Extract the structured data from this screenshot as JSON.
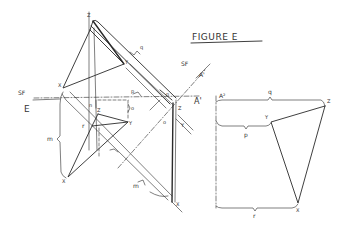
{
  "figure": {
    "title": "FIGURE E",
    "left_view": {
      "fold_line_label": "SF",
      "view_label": "E",
      "points_upper": {
        "z": "Z",
        "x": "X",
        "y": "Y"
      },
      "points_lower": {
        "z": "Z",
        "r": "r",
        "y": "Y",
        "x": "X"
      },
      "dimension_labels": {
        "q": "q",
        "p": "p",
        "n": "n",
        "o": "o",
        "m_left": "m",
        "m_band": "m",
        "n_band": "n",
        "z_band": "Z",
        "y_band": "Y",
        "x_band": "X",
        "o_band": "o"
      }
    },
    "fold_line": {
      "label_sf": "SF",
      "label_a1_top": "A'",
      "label_a1": "A'",
      "label_a2": "A²"
    },
    "right_view": {
      "points": {
        "z": "Z",
        "y": "Y",
        "x": "X"
      },
      "dimension_labels": {
        "q": "q",
        "p": "p",
        "r": "r"
      }
    }
  }
}
